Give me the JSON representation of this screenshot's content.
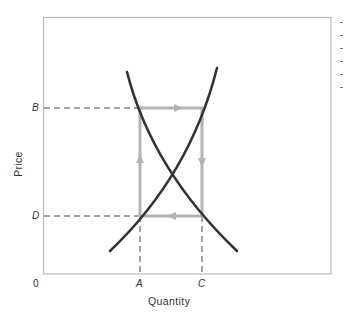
{
  "diagram": {
    "type": "supply-demand cobweb / price adjustment",
    "axes": {
      "x_label": "Quantity",
      "y_label": "Price",
      "origin_label": "0",
      "x_ticks": [
        {
          "label": "A",
          "x": 140
        },
        {
          "label": "C",
          "x": 202
        }
      ],
      "y_ticks": [
        {
          "label": "B",
          "y": 108
        },
        {
          "label": "D",
          "y": 216
        }
      ]
    },
    "curves": [
      {
        "name": "demand",
        "description": "downward sloping",
        "from": [
          127,
          72
        ],
        "to": [
          237,
          251
        ]
      },
      {
        "name": "supply",
        "description": "upward sloping",
        "from": [
          110,
          251
        ],
        "to": [
          217,
          68
        ]
      }
    ],
    "equilibrium": {
      "x": 169,
      "y": 170
    },
    "cycle": {
      "description": "clockwise adjustment loop",
      "arrows": [
        "up (left side)",
        "right (top)",
        "down (right side)",
        "left (bottom)"
      ]
    },
    "colors": {
      "curves": "#333333",
      "cycle": "#b3b3b3",
      "frame": "#bdbdbd",
      "dashes": "#333333"
    }
  }
}
